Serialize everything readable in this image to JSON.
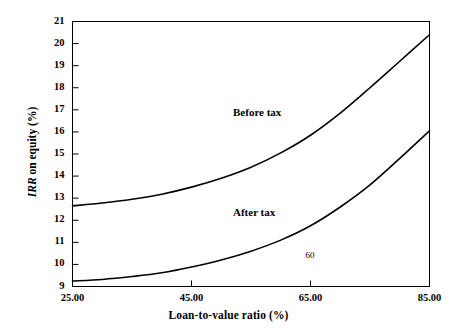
{
  "chart_data": {
    "type": "line",
    "title": "",
    "xlabel": "Loan-to-value ratio (%)",
    "ylabel": "IRR on equity (%)",
    "ylabel_italic_part": "IRR",
    "ylabel_rest": " on equity (%)",
    "xlim": [
      25.0,
      85.0
    ],
    "ylim": [
      9,
      21
    ],
    "grid": false,
    "legend_position": "inline-annotation",
    "xticks": [
      25.0,
      45.0,
      65.0,
      85.0
    ],
    "xtick_labels": [
      "25.00",
      "45.00",
      "65.00",
      "85.00"
    ],
    "yticks": [
      9,
      10,
      11,
      12,
      13,
      14,
      15,
      16,
      17,
      18,
      19,
      20,
      21
    ],
    "ytick_labels": [
      "9",
      "10",
      "11",
      "12",
      "13",
      "14",
      "15",
      "16",
      "17",
      "18",
      "19",
      "20",
      "21"
    ],
    "x": [
      25,
      30,
      35,
      40,
      45,
      50,
      55,
      60,
      65,
      70,
      75,
      80,
      85
    ],
    "series": [
      {
        "name": "Before tax",
        "label": "Before tax",
        "color": "#000000",
        "values": [
          12.65,
          12.78,
          12.95,
          13.18,
          13.5,
          13.9,
          14.4,
          15.05,
          15.85,
          16.85,
          18.0,
          19.2,
          20.4
        ]
      },
      {
        "name": "After tax",
        "label": "After tax",
        "color": "#000000",
        "values": [
          9.25,
          9.32,
          9.45,
          9.62,
          9.88,
          10.2,
          10.6,
          11.1,
          11.75,
          12.6,
          13.6,
          14.8,
          16.05
        ]
      }
    ],
    "annotations": [
      {
        "text": "60",
        "x": 65.0,
        "y": 10.4
      }
    ]
  },
  "labels": {
    "before_tax": "Before tax",
    "after_tax": "After tax",
    "point_60": "60"
  },
  "colors": {
    "axis": "#000000",
    "curve": "#1a1a1a",
    "background": "#ffffff"
  }
}
